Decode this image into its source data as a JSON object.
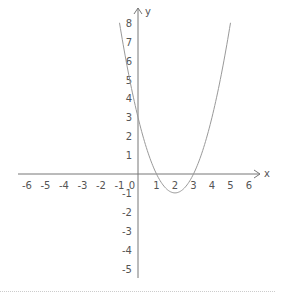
{
  "chart_data": {
    "type": "line",
    "title": "",
    "xlabel": "x",
    "ylabel": "y",
    "function": "y = x^2 - 4x + 3",
    "xlim": [
      -6.5,
      6.5
    ],
    "ylim": [
      -5.5,
      8.5
    ],
    "x_ticks": [
      -6,
      -5,
      -4,
      -3,
      -2,
      -1,
      0,
      1,
      2,
      3,
      4,
      5,
      6
    ],
    "y_ticks": [
      -5,
      -4,
      -3,
      -2,
      -1,
      1,
      2,
      3,
      4,
      5,
      6,
      7,
      8
    ],
    "grid": false,
    "series": [
      {
        "name": "parabola",
        "x": [
          -1,
          -0.5,
          0,
          0.5,
          1,
          1.5,
          2,
          2.5,
          3,
          3.5,
          4,
          4.5,
          5
        ],
        "values": [
          8,
          5.25,
          3,
          1.25,
          0,
          -0.75,
          -1,
          -0.75,
          0,
          1.25,
          3,
          5.25,
          8
        ]
      }
    ],
    "annotations": {
      "vertex": [
        2,
        -1
      ],
      "roots": [
        1,
        3
      ],
      "y_intercept": 3
    }
  },
  "colors": {
    "axis": "#777777",
    "curve": "#999999",
    "text": "#555555",
    "divider": "#cccccc"
  }
}
